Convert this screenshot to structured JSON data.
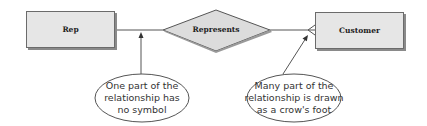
{
  "diagram": {
    "type": "entity-relationship",
    "entities": [
      {
        "id": "rep",
        "label": "Rep"
      },
      {
        "id": "customer",
        "label": "Customer"
      }
    ],
    "relationship": {
      "label": "Represents",
      "from": "rep",
      "to": "customer",
      "from_cardinality": "one (no symbol)",
      "to_cardinality": "many (crow's foot)"
    },
    "callouts": [
      {
        "id": "one-side",
        "lines": [
          "One part of the",
          "relationship has",
          "no symbol"
        ],
        "points_to": "rep-side connector"
      },
      {
        "id": "many-side",
        "lines": [
          "Many part of the",
          "relationship is drawn",
          "as a crow's foot"
        ],
        "points_to": "crow's foot at customer"
      }
    ],
    "colors": {
      "entity_fill": "#e6e6e6",
      "entity_border": "#6b6b6b",
      "line": "#555555",
      "callout_border": "#555555"
    }
  }
}
